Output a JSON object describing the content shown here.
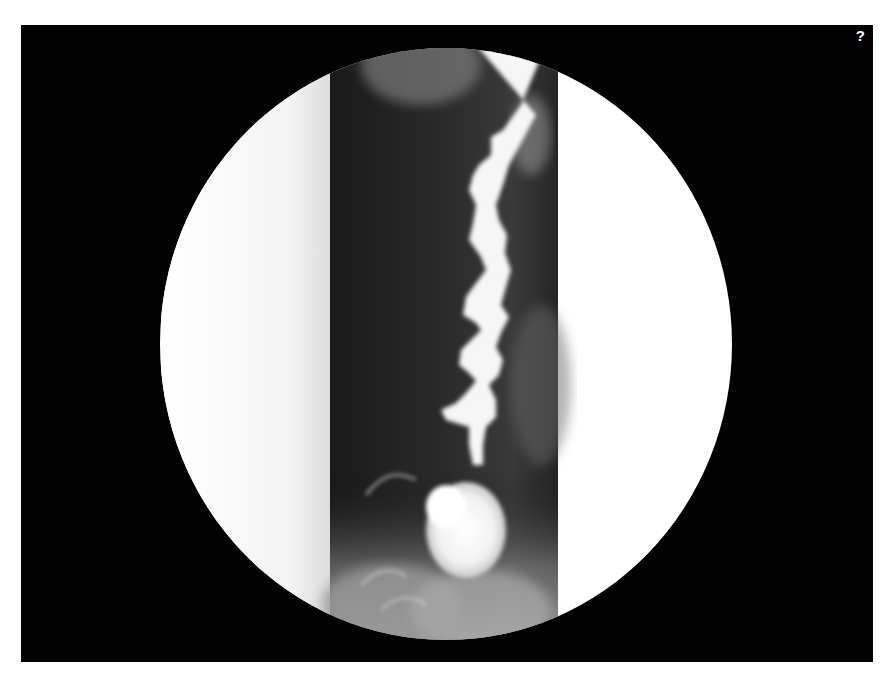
{
  "viewer": {
    "help_label": "?",
    "image": {
      "subject": "fluoroscopic barium swallow (esophagram)",
      "field_of_view": "circular",
      "background_color": "#020202",
      "fov_color": "#ffffff"
    }
  }
}
